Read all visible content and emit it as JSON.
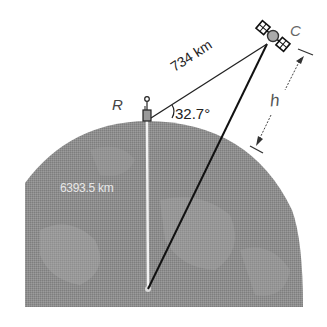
{
  "diagram": {
    "labels": {
      "station": "R",
      "satellite": "C",
      "height": "h",
      "slant_distance": "734 km",
      "elevation_angle": "32.7°",
      "earth_radius": "6393.5 km"
    },
    "colors": {
      "earth_fill": "#8c8c8c",
      "earth_patches": "#9a9a9a",
      "radius_line": "#f2f2f2",
      "line": "#111111",
      "background": "#ffffff"
    }
  }
}
